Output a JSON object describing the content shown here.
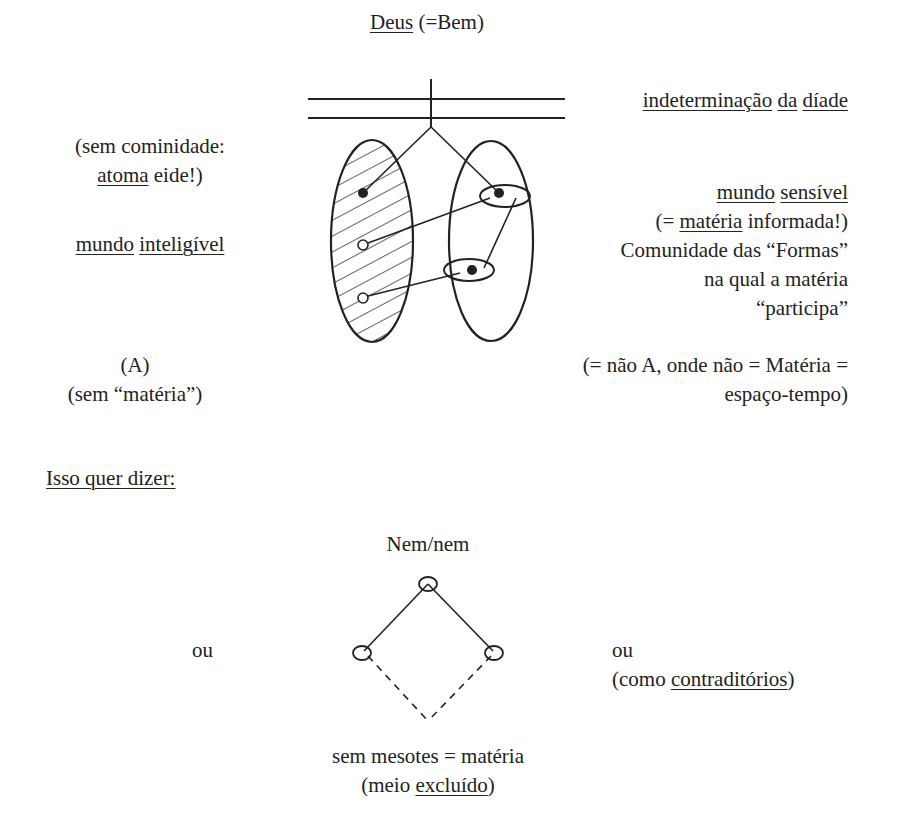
{
  "top": {
    "deus": "Deus",
    "deus_suffix": " (=Bem)",
    "indet_1": "indeterminação",
    "indet_sp1": " ",
    "indet_2": "da",
    "indet_sp2": " ",
    "indet_3": "díade"
  },
  "left": {
    "line1": "(sem cominidade:",
    "line2_u": "atoma",
    "line2_rest": " eide!)",
    "world_1": "mundo",
    "world_sp": " ",
    "world_2": "inteligível",
    "a_label": "(A)",
    "a_note": "(sem “matéria”)"
  },
  "right": {
    "world_1": "mundo",
    "world_sp": " ",
    "world_2": "sensível",
    "line2_pre": "(= ",
    "line2_u": "matéria",
    "line2_rest": " informada!)",
    "line3": "Comunidade das “Formas”",
    "line4": "na qual a matéria",
    "line5": "“participa”",
    "nota_line1": "(= não A, onde não = Matéria =",
    "nota_line2": "espaço-tempo)"
  },
  "bottom": {
    "heading": "Isso quer dizer:",
    "nem_nem": "Nem/nem",
    "ou_left": "ou",
    "ou_right": "ou",
    "contra_pre": "(como ",
    "contra_u": "contraditórios",
    "contra_post": ")",
    "mesotes": "sem mesotes = matéria",
    "meio_pre": "(meio ",
    "meio_u": "excluído",
    "meio_post": ")"
  },
  "colors": {
    "ink": "#222222",
    "background": "#ffffff"
  }
}
